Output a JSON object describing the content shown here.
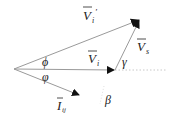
{
  "diagram": {
    "type": "phasor-diagram",
    "origin": [
      14,
      69
    ],
    "colors": {
      "line": "#9a9a9a",
      "arrowhead": "#111111",
      "text": "#222222",
      "dotted": "#c8c8c8"
    },
    "vectors": [
      {
        "id": "Vi_prime",
        "label": "V",
        "sub": "i",
        "prime": "′",
        "from": [
          14,
          69
        ],
        "to": [
          140,
          19
        ]
      },
      {
        "id": "Vi",
        "label": "V",
        "sub": "i",
        "prime": "",
        "from": [
          14,
          69
        ],
        "to": [
          115,
          70
        ]
      },
      {
        "id": "Vs",
        "label": "V",
        "sub": "s",
        "prime": "",
        "from": [
          115,
          70
        ],
        "to": [
          140,
          19
        ]
      },
      {
        "id": "Iij",
        "label": "I",
        "sub": "ij",
        "prime": "",
        "from": [
          14,
          69
        ],
        "to": [
          80,
          96
        ]
      }
    ],
    "angles": [
      {
        "id": "phi_upper",
        "symbol": "ϕ"
      },
      {
        "id": "phi_lower",
        "symbol": "φ"
      },
      {
        "id": "gamma",
        "symbol": "γ"
      },
      {
        "id": "beta",
        "symbol": "β"
      }
    ]
  }
}
